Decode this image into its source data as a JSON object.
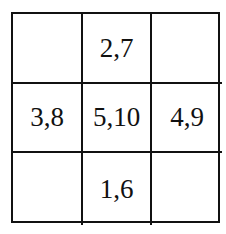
{
  "grid": {
    "rows": 3,
    "cols": 3,
    "cells": [
      [
        "",
        "2,7",
        ""
      ],
      [
        "3,8",
        "5,10",
        "4,9"
      ],
      [
        "",
        "1,6",
        ""
      ]
    ]
  }
}
